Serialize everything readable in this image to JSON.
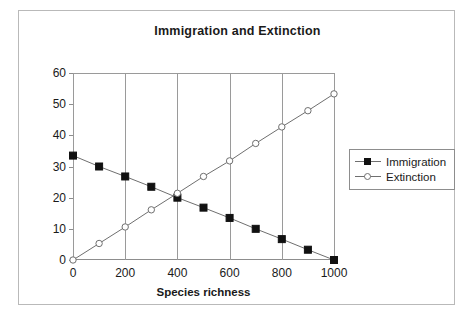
{
  "chart_data": {
    "type": "line",
    "title": "Immigration and Extinction",
    "xlabel": "Species richness",
    "ylabel": "",
    "xlim": [
      0,
      1000
    ],
    "ylim": [
      0,
      60
    ],
    "x_ticks": [
      "0",
      "200",
      "400",
      "600",
      "800",
      "1000"
    ],
    "y_ticks": [
      "0",
      "10",
      "20",
      "30",
      "40",
      "50",
      "60"
    ],
    "x": [
      0,
      100,
      200,
      300,
      400,
      500,
      600,
      700,
      800,
      900,
      1000
    ],
    "grid": "vertical",
    "legend_position": "right",
    "series": [
      {
        "name": "Immigration",
        "marker": "filled-square",
        "color": "#111111",
        "values": [
          33.5,
          30.0,
          26.8,
          23.5,
          20.0,
          16.8,
          13.5,
          10.0,
          6.7,
          3.3,
          0.0
        ]
      },
      {
        "name": "Extinction",
        "marker": "open-circle",
        "color": "#6f6f6f",
        "values": [
          0.0,
          5.3,
          10.6,
          16.1,
          21.4,
          26.8,
          31.8,
          37.4,
          42.7,
          47.9,
          53.3
        ]
      }
    ]
  },
  "legend": {
    "items": [
      {
        "label": "Immigration"
      },
      {
        "label": "Extinction"
      }
    ]
  }
}
